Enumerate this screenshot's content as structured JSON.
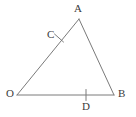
{
  "figure": {
    "kind": "geometry-diagram",
    "shape": "triangle",
    "background_color": "#ffffff",
    "stroke_color": "#7a7a7a",
    "label_color": "#3b3b3b",
    "stroke_width": 1,
    "width": 136,
    "height": 117,
    "vertices": [
      {
        "id": "O",
        "label": "O",
        "x": 17,
        "y": 95,
        "label_x": 6,
        "label_y": 88
      },
      {
        "id": "A",
        "label": "A",
        "x": 79,
        "y": 19,
        "label_x": 74,
        "label_y": 3
      },
      {
        "id": "B",
        "label": "B",
        "x": 114,
        "y": 95,
        "label_x": 118,
        "label_y": 88
      }
    ],
    "points": [
      {
        "id": "C",
        "label": "C",
        "x": 59,
        "y": 38,
        "on_segment": "OA",
        "label_x": 47,
        "label_y": 29
      },
      {
        "id": "D",
        "label": "D",
        "x": 86,
        "y": 95,
        "on_segment": "OB",
        "label_x": 82,
        "label_y": 101
      }
    ],
    "segments": [
      {
        "id": "OA",
        "from": "O",
        "to": "A"
      },
      {
        "id": "AB",
        "from": "A",
        "to": "B"
      },
      {
        "id": "OB",
        "from": "O",
        "to": "B"
      }
    ],
    "tick_marks": [
      {
        "id": "tick-C",
        "at_point": "C",
        "x": 59,
        "y": 38,
        "orientation": "cross-stroke",
        "length": 11
      },
      {
        "id": "tick-D",
        "at_point": "D",
        "x": 86,
        "y": 95,
        "orientation": "vertical",
        "length": 11
      }
    ]
  }
}
